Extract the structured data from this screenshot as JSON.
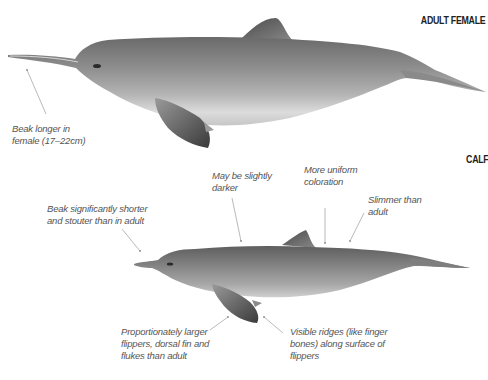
{
  "adult": {
    "heading": "ADULT FEMALE",
    "annotations": [
      {
        "id": "beak-female",
        "lines": [
          "Beak longer in",
          "female (17–22cm)"
        ]
      }
    ]
  },
  "calf": {
    "heading": "CALF",
    "annotations": [
      {
        "id": "darker",
        "lines": [
          "May be slightly",
          "darker"
        ]
      },
      {
        "id": "uniform",
        "lines": [
          "More uniform",
          "coloration"
        ]
      },
      {
        "id": "slimmer",
        "lines": [
          "Slimmer than",
          "adult"
        ]
      },
      {
        "id": "beak-shorter",
        "lines": [
          "Beak significantly shorter",
          "and stouter than in adult"
        ]
      },
      {
        "id": "larger-flippers",
        "lines": [
          "Proportionately larger",
          "flippers, dorsal fin and",
          "flukes than adult"
        ]
      },
      {
        "id": "ridges",
        "lines": [
          "Visible ridges (like finger",
          "bones) along surface of",
          "flippers"
        ]
      }
    ]
  },
  "colors": {
    "body_dark": "#6e6e6e",
    "body_mid": "#9a9a9a",
    "belly": "#e4e4e4",
    "pointer": "#8a8a8a",
    "label_text": "#555555"
  }
}
